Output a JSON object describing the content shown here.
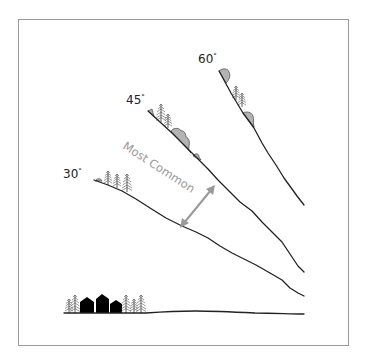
{
  "diagram": {
    "type": "avalanche slope angle illustration",
    "slopes": [
      {
        "label": "60",
        "degree_symbol": "°",
        "angle": 60
      },
      {
        "label": "45",
        "degree_symbol": "°",
        "angle": 45
      },
      {
        "label": "30",
        "degree_symbol": "°",
        "angle": 30
      }
    ],
    "annotation": {
      "text": "Most Common",
      "arrow": "double-headed arrow spanning between 30° and 45° slopes"
    },
    "valley": {
      "elements": [
        "trees",
        "houses",
        "trees"
      ],
      "house_count": 3
    },
    "colors": {
      "line": "#222222",
      "snow_fill": "#b3b3b3",
      "annotation": "#999999",
      "frame": "#9a9a9a",
      "house": "#000000"
    }
  }
}
